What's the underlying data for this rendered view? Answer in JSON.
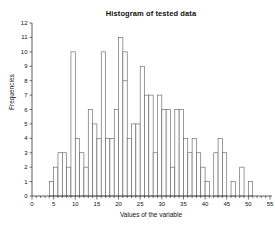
{
  "window": {
    "background_color": "#ffffff"
  },
  "chart_data": {
    "type": "bar",
    "subtype": "histogram",
    "title": "Histogram of tested data",
    "xlabel": "Values of the variable",
    "ylabel": "Frequencies",
    "xlim": [
      0,
      55
    ],
    "ylim": [
      0,
      12
    ],
    "grid": false,
    "legend": "none",
    "bin_width": 1,
    "first_bin_start": 4,
    "bin_starts": [
      4,
      5,
      6,
      7,
      8,
      9,
      10,
      11,
      12,
      13,
      14,
      15,
      16,
      17,
      18,
      19,
      20,
      21,
      22,
      23,
      24,
      25,
      26,
      27,
      28,
      29,
      30,
      31,
      32,
      33,
      34,
      35,
      36,
      37,
      38,
      39,
      40,
      41,
      42,
      43,
      44,
      45,
      46,
      47,
      48,
      49,
      50
    ],
    "counts": [
      1,
      2,
      3,
      3,
      2,
      10,
      4,
      3,
      2,
      6,
      5,
      4,
      10,
      4,
      4,
      6,
      11,
      10,
      4,
      5,
      5,
      9,
      7,
      7,
      3,
      7,
      6,
      6,
      2,
      6,
      6,
      4,
      3,
      4,
      3,
      2,
      1,
      0,
      3,
      4,
      3,
      0,
      1,
      0,
      2,
      0,
      1
    ],
    "inner_line": {
      "bin": 21,
      "level": 8
    },
    "x_tick_labels": [
      "0",
      "5",
      "10",
      "15",
      "20",
      "25",
      "30",
      "35",
      "40",
      "45",
      "50",
      "55"
    ],
    "x_major_tick_step": 5,
    "x_minor_tick_step": 1,
    "y_tick_labels": [
      "0",
      "1",
      "2",
      "3",
      "4",
      "5",
      "6",
      "7",
      "8",
      "9",
      "10",
      "11",
      "12"
    ],
    "bar_fill": "#fefefe",
    "bar_stroke": "#5a5a5a",
    "axis_color": "#333333",
    "text_color": "#111111"
  }
}
